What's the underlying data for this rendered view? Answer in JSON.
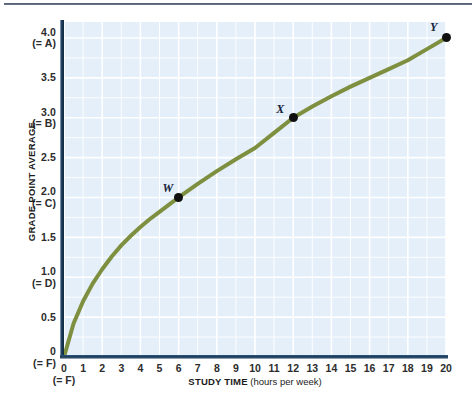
{
  "figure": {
    "background_color": "#ffffff",
    "plot_background_color": "#e4eff9",
    "gridline_color": "#ffffff",
    "axis_color": "#15334f",
    "curve_color": "#7f8f40",
    "point_color": "#101010"
  },
  "axes": {
    "y_title": "GRADE POINT AVERAGE",
    "x_title_strong": "STUDY TIME",
    "x_title_light": " (hours per week)",
    "y_ticks": [
      {
        "value": 4.0,
        "label": "4.0",
        "sub": "(= A)"
      },
      {
        "value": 3.5,
        "label": "3.5",
        "sub": ""
      },
      {
        "value": 3.0,
        "label": "3.0",
        "sub": "(= B)"
      },
      {
        "value": 2.5,
        "label": "2.5",
        "sub": ""
      },
      {
        "value": 2.0,
        "label": "2.0",
        "sub": "(= C)"
      },
      {
        "value": 1.5,
        "label": "1.5",
        "sub": ""
      },
      {
        "value": 1.0,
        "label": "1.0",
        "sub": "(= D)"
      },
      {
        "value": 0.5,
        "label": "0.5",
        "sub": ""
      },
      {
        "value": 0.0,
        "label": "0",
        "sub": "(= F)"
      }
    ],
    "x_ticks": [
      {
        "value": 0,
        "label": "0"
      },
      {
        "value": 1,
        "label": "1"
      },
      {
        "value": 2,
        "label": "2"
      },
      {
        "value": 3,
        "label": "3"
      },
      {
        "value": 4,
        "label": "4"
      },
      {
        "value": 5,
        "label": "5"
      },
      {
        "value": 6,
        "label": "6"
      },
      {
        "value": 7,
        "label": "7"
      },
      {
        "value": 8,
        "label": "8"
      },
      {
        "value": 9,
        "label": "9"
      },
      {
        "value": 10,
        "label": "10"
      },
      {
        "value": 11,
        "label": "11"
      },
      {
        "value": 12,
        "label": "12"
      },
      {
        "value": 13,
        "label": "13"
      },
      {
        "value": 14,
        "label": "14"
      },
      {
        "value": 15,
        "label": "15"
      },
      {
        "value": 16,
        "label": "16"
      },
      {
        "value": 17,
        "label": "17"
      },
      {
        "value": 18,
        "label": "18"
      },
      {
        "value": 19,
        "label": "19"
      },
      {
        "value": 20,
        "label": "20"
      }
    ]
  },
  "chart_data": {
    "type": "line",
    "title": "",
    "subtitle": "",
    "xlabel": "STUDY TIME (hours per week)",
    "ylabel": "GRADE POINT AVERAGE",
    "xlim": [
      0,
      20
    ],
    "ylim": [
      0,
      4.2
    ],
    "grid": true,
    "legend": "none",
    "series": [
      {
        "name": "Grade point average vs. study time",
        "color": "#7f8f40",
        "x": [
          0,
          0.5,
          1,
          1.5,
          2,
          2.5,
          3,
          3.5,
          4,
          4.5,
          5,
          5.5,
          6,
          7,
          8,
          9,
          10,
          11,
          12,
          13,
          14,
          15,
          16,
          17,
          18,
          19,
          20
        ],
        "y": [
          0,
          0.42,
          0.7,
          0.92,
          1.1,
          1.26,
          1.4,
          1.52,
          1.63,
          1.73,
          1.82,
          1.91,
          2.0,
          2.17,
          2.33,
          2.48,
          2.62,
          2.81,
          3.0,
          3.14,
          3.27,
          3.39,
          3.5,
          3.61,
          3.72,
          3.86,
          4.0
        ]
      }
    ],
    "annotated_points": [
      {
        "name": "W",
        "label": "W",
        "x": 6,
        "y": 2.0,
        "label_dx": -16,
        "label_dy": -16
      },
      {
        "name": "X",
        "label": "X",
        "x": 12,
        "y": 3.0,
        "label_dx": -17,
        "label_dy": -16
      },
      {
        "name": "Y",
        "label": "Y",
        "x": 20,
        "y": 4.0,
        "label_dx": -16,
        "label_dy": -18
      }
    ],
    "grid_minor_x_step": 1,
    "grid_major_x_step": 2,
    "grid_minor_y_step": 0.25,
    "grid_major_y_step": 0.5
  }
}
